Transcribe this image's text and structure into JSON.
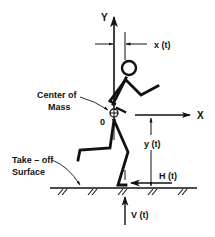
{
  "diagram": {
    "axes": {
      "y_label": "Y",
      "x_label": "X",
      "origin_label": "0"
    },
    "labels": {
      "x_t": "x (t)",
      "y_t": "y (t)",
      "h_t": "H (t)",
      "v_t": "V (t)",
      "center_of_mass_line1": "Center of",
      "center_of_mass_line2": "Mass",
      "surface_line1": "Take – off",
      "surface_line2": "Surface"
    },
    "colors": {
      "ink": "#111111",
      "background": "#ffffff"
    }
  }
}
